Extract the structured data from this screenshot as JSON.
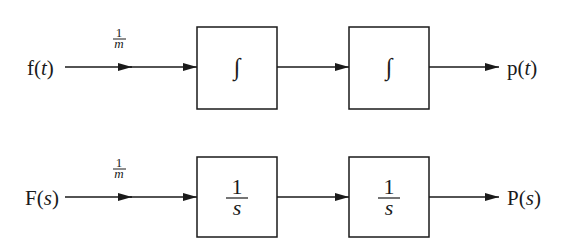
{
  "diagram": {
    "type": "block-diagram",
    "rows": [
      {
        "id": "time-domain",
        "input": {
          "func": "f",
          "var": "t"
        },
        "gain": {
          "numerator": "1",
          "denominator": "m"
        },
        "blocks": [
          {
            "kind": "integral",
            "symbol": "∫"
          },
          {
            "kind": "integral",
            "symbol": "∫"
          }
        ],
        "output": {
          "func": "p",
          "var": "t"
        }
      },
      {
        "id": "laplace-domain",
        "input": {
          "func": "F",
          "var": "s"
        },
        "gain": {
          "numerator": "1",
          "denominator": "m"
        },
        "blocks": [
          {
            "kind": "transfer",
            "numerator": "1",
            "denominator": "s"
          },
          {
            "kind": "transfer",
            "numerator": "1",
            "denominator": "s"
          }
        ],
        "output": {
          "func": "P",
          "var": "s"
        }
      }
    ],
    "colors": {
      "stroke": "#1a1a1a",
      "background": "#ffffff"
    }
  },
  "text": {
    "paren_open": "(",
    "paren_close": ")"
  }
}
